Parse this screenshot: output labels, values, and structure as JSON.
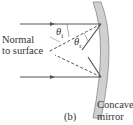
{
  "diagram": {
    "panel_label": "(b)",
    "normal_label_line1": "Normal",
    "normal_label_line2": "to surface",
    "mirror_label_line1": "Concave",
    "mirror_label_line2": "mirror",
    "angle_incident": "θ",
    "angle_incident_sub": "i",
    "angle_reflected": "θ",
    "angle_reflected_sub": "r",
    "colors": {
      "ray": "#555555",
      "mirror_fill": "#d0d0d0",
      "mirror_stroke": "#888888",
      "text": "#333333"
    }
  }
}
